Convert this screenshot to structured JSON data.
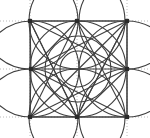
{
  "figure": {
    "type": "diagram",
    "canvas": {
      "width": 150,
      "height": 138,
      "background": "#ffffff"
    },
    "style": {
      "stroke_color": "#3f3f3f",
      "stroke_width": 1.1,
      "grid_color": "#a8a8a8",
      "grid_width": 0.8,
      "grid_dash": "1,2",
      "node_fill": "#2a2a2a",
      "node_size": 4.2
    },
    "grid": {
      "x_positions": [
        30,
        77,
        127
      ],
      "y_positions": [
        21,
        69,
        117
      ],
      "extend_to_edges": true
    },
    "nodes": [
      {
        "name": "top-left",
        "x": 30,
        "y": 21
      },
      {
        "name": "top-center",
        "x": 77,
        "y": 21
      },
      {
        "name": "top-right",
        "x": 127,
        "y": 21
      },
      {
        "name": "middle-left",
        "x": 31,
        "y": 69
      },
      {
        "name": "middle-right",
        "x": 127,
        "y": 69
      },
      {
        "name": "bottom-left",
        "x": 30,
        "y": 117
      },
      {
        "name": "bottom-center",
        "x": 77,
        "y": 117
      },
      {
        "name": "bottom-right",
        "x": 127,
        "y": 117
      }
    ],
    "center": {
      "x": 78,
      "y": 69
    },
    "chords": [
      [
        0,
        1
      ],
      [
        1,
        2
      ],
      [
        0,
        3
      ],
      [
        2,
        4
      ],
      [
        3,
        5
      ],
      [
        4,
        7
      ],
      [
        5,
        6
      ],
      [
        6,
        7
      ],
      [
        0,
        2
      ],
      [
        5,
        7
      ],
      [
        0,
        5
      ],
      [
        2,
        7
      ],
      [
        0,
        4
      ],
      [
        0,
        6
      ],
      [
        1,
        3
      ],
      [
        1,
        4
      ],
      [
        1,
        5
      ],
      [
        1,
        7
      ],
      [
        2,
        3
      ],
      [
        2,
        6
      ],
      [
        3,
        4
      ],
      [
        3,
        6
      ],
      [
        4,
        5
      ],
      [
        4,
        6
      ],
      [
        3,
        7
      ],
      [
        5,
        2
      ],
      [
        6,
        0
      ],
      [
        6,
        2
      ]
    ],
    "circles": [
      {
        "name": "circle-top-left",
        "cx": 30,
        "cy": 21,
        "r": 48
      },
      {
        "name": "circle-top-center",
        "cx": 77,
        "cy": 21,
        "r": 48
      },
      {
        "name": "circle-top-right",
        "cx": 127,
        "cy": 21,
        "r": 48
      },
      {
        "name": "circle-middle-left",
        "cx": 31,
        "cy": 69,
        "r": 48
      },
      {
        "name": "circle-middle-right",
        "cx": 127,
        "cy": 69,
        "r": 48
      },
      {
        "name": "circle-bottom-left",
        "cx": 30,
        "cy": 117,
        "r": 48
      },
      {
        "name": "circle-bottom-center",
        "cx": 77,
        "cy": 117,
        "r": 48
      },
      {
        "name": "circle-bottom-right",
        "cx": 127,
        "cy": 117,
        "r": 48
      },
      {
        "name": "circle-center-inner",
        "cx": 78,
        "cy": 69,
        "r": 18
      },
      {
        "name": "circle-center-mid",
        "cx": 78,
        "cy": 69,
        "r": 33
      },
      {
        "name": "circle-center-outer",
        "cx": 78,
        "cy": 69,
        "r": 48
      }
    ]
  }
}
